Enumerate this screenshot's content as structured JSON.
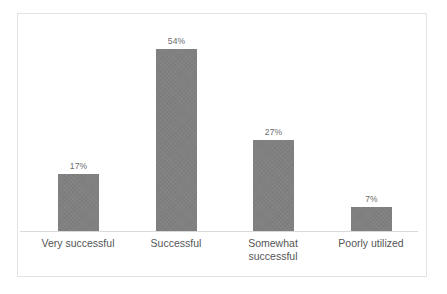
{
  "figure": {
    "background_color": "#ffffff",
    "frame_color": "#e3e3e3",
    "axis_line_color": "#d9d9d9"
  },
  "chart_data": {
    "type": "bar",
    "title": "",
    "subtitle": "",
    "xlabel": "",
    "ylabel": "",
    "categories": [
      "Very successful",
      "Successful",
      "Somewhat successful",
      "Poorly utilized"
    ],
    "values": [
      17,
      54,
      27,
      7
    ],
    "value_labels": [
      "17%",
      "54%",
      "27%",
      "7%"
    ],
    "series": [
      {
        "name": "",
        "values": [
          17,
          54,
          27,
          7
        ],
        "color": "#808080"
      }
    ],
    "ylim": [
      0,
      63
    ],
    "grid": false,
    "legend": false,
    "legend_position": "none",
    "y_axis_visible": false,
    "y_tick_labels": [],
    "x_tick_labels": [
      "Very successful",
      "Successful",
      "Somewhat successful",
      "Poorly utilized"
    ],
    "data_labels_shown": true,
    "units": "percent",
    "annotations": []
  }
}
